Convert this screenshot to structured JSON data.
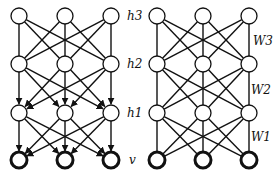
{
  "left_network": {
    "name": "deep-belief-network",
    "layers": [
      {
        "id": "h3",
        "label": "h3",
        "y": 16
      },
      {
        "id": "h2",
        "label": "h2",
        "y": 64
      },
      {
        "id": "h1",
        "label": "h1",
        "y": 113
      },
      {
        "id": "v",
        "label": "v",
        "y": 160
      }
    ],
    "columns_x": [
      19,
      65,
      111
    ],
    "edges": [
      {
        "from": "h3",
        "to": "h2",
        "directed": false
      },
      {
        "from": "h2",
        "to": "h1",
        "directed": true
      },
      {
        "from": "h1",
        "to": "v",
        "directed": true
      }
    ]
  },
  "right_network": {
    "name": "deep-boltzmann-machine-weights",
    "layers": [
      {
        "id": "h3",
        "y": 16
      },
      {
        "id": "h2",
        "y": 64
      },
      {
        "id": "h1",
        "y": 113
      },
      {
        "id": "v",
        "y": 160
      }
    ],
    "columns_x": [
      157,
      203,
      249
    ],
    "weights": [
      {
        "label": "W3",
        "between": [
          "h3",
          "h2"
        ]
      },
      {
        "label": "W2",
        "between": [
          "h2",
          "h1"
        ]
      },
      {
        "label": "W1",
        "between": [
          "h1",
          "v"
        ]
      }
    ]
  },
  "labels": {
    "h3": "h3",
    "h2": "h2",
    "h1": "h1",
    "v": "v",
    "W3": "W3",
    "W2": "W2",
    "W1": "W1"
  },
  "colors": {
    "stroke": "#111111",
    "fill": "#ffffff"
  }
}
